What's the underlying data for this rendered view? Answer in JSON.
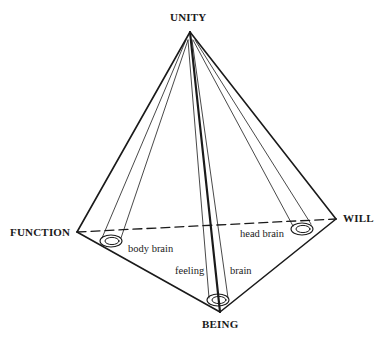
{
  "diagram": {
    "type": "pyramid",
    "vertices": {
      "apex": {
        "label": "UNITY",
        "x": 190,
        "y": 32
      },
      "left": {
        "label": "FUNCTION",
        "x": 77,
        "y": 232
      },
      "right": {
        "label": "WILL",
        "x": 336,
        "y": 219
      },
      "bottom": {
        "label": "BEING",
        "x": 220,
        "y": 312
      }
    },
    "tubes": [
      {
        "id": "body-brain",
        "label": "body brain",
        "cx": 111,
        "cy": 241
      },
      {
        "id": "head-brain",
        "label": "head brain",
        "cx": 302,
        "cy": 229
      },
      {
        "id": "center",
        "labels": [
          "feeling",
          "brain"
        ],
        "cx": 218,
        "cy": 300
      }
    ],
    "colors": {
      "line": "#1a1a1a",
      "background": "#ffffff"
    }
  }
}
